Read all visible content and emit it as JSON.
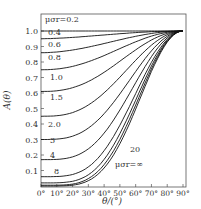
{
  "chart_data": {
    "type": "line",
    "title": "",
    "xlabel": "θ/(°)",
    "ylabel": "A(θ)",
    "xlim": [
      0,
      90
    ],
    "ylim": [
      0,
      1.0
    ],
    "x_ticks": [
      "0°",
      "10°",
      "20°",
      "30°",
      "40°",
      "50°",
      "60°",
      "70°",
      "80°",
      "90°"
    ],
    "y_ticks": [
      "0.1",
      "0.2",
      "0.3",
      "0.4",
      "0.5",
      "0.6",
      "0.7",
      "0.8",
      "0.9",
      "1.0"
    ],
    "legend_title": "μσr = 0.2",
    "grid": false,
    "series": [
      {
        "name": "0.2",
        "y0": 1.0
      },
      {
        "name": "0.4",
        "y0": 0.95
      },
      {
        "name": "0.6",
        "y0": 0.86
      },
      {
        "name": "0.8",
        "y0": 0.75
      },
      {
        "name": "1.0",
        "y0": 0.61
      },
      {
        "name": "1.5",
        "y0": 0.45
      },
      {
        "name": "2.0",
        "y0": 0.3
      },
      {
        "name": "3",
        "y0": 0.17
      },
      {
        "name": "4",
        "y0": 0.06
      },
      {
        "name": "8",
        "y0": 0.02
      },
      {
        "name": "20",
        "y0": 0.005
      },
      {
        "name": "∞",
        "y0": 0.0
      }
    ],
    "annotations": [
      "μσr=0.2",
      "0.4",
      "0.6",
      "0.8",
      "1.0",
      "1.5",
      "2.0",
      "3",
      "4",
      "8",
      "20",
      "μσr=∞"
    ]
  }
}
